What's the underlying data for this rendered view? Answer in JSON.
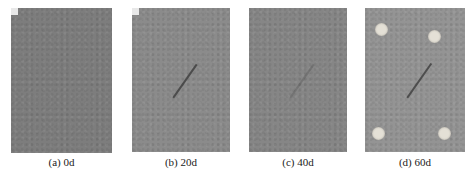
{
  "figure": {
    "panels": [
      {
        "id": "a",
        "label": "(a) 0d",
        "color": "#7d7d7d",
        "x": 11,
        "w": 101,
        "h": 145,
        "crack": false,
        "dots": []
      },
      {
        "id": "b",
        "label": "(b) 20d",
        "color": "#8b8b8b",
        "x": 132,
        "w": 98,
        "h": 144,
        "crack": true,
        "dots": []
      },
      {
        "id": "c",
        "label": "(c) 40d",
        "color": "#868686",
        "x": 249,
        "w": 98,
        "h": 144,
        "crack": true,
        "dots": []
      },
      {
        "id": "d",
        "label": "(d) 60d",
        "color": "#949494",
        "x": 365,
        "w": 100,
        "h": 144,
        "crack": true,
        "dots": [
          [
            10,
            15
          ],
          [
            63,
            22
          ],
          [
            7,
            119
          ],
          [
            73,
            119
          ]
        ]
      }
    ]
  }
}
